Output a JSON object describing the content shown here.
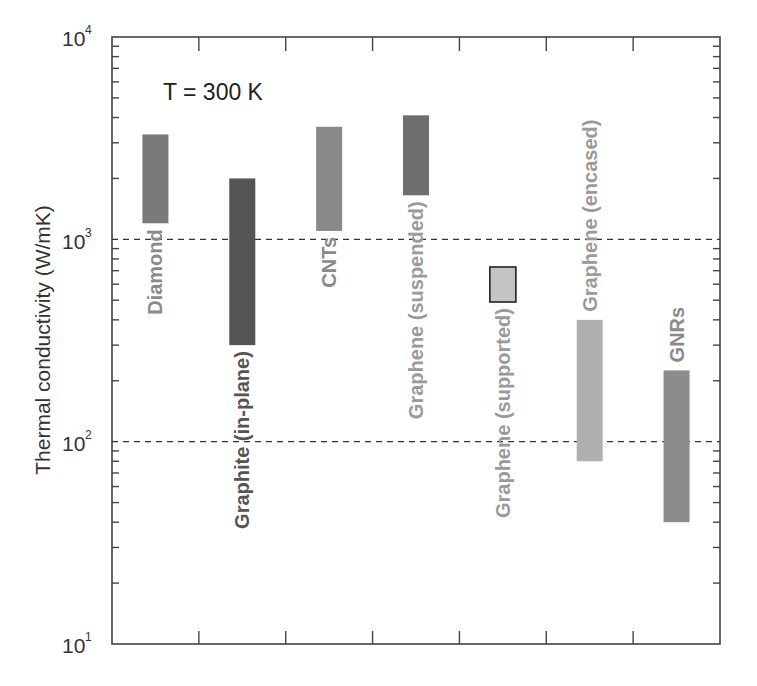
{
  "chart_data": {
    "type": "bar",
    "subtype": "floating-range-bar",
    "title": "",
    "annotation": "T = 300 K",
    "xlabel": "",
    "ylabel": "Thermal conductivity (W/mK)",
    "yscale": "log",
    "ylim": [
      10,
      10000
    ],
    "y_ticks": [
      {
        "base": "10",
        "exp": "1",
        "value": 10
      },
      {
        "base": "10",
        "exp": "2",
        "value": 100
      },
      {
        "base": "10",
        "exp": "3",
        "value": 1000
      },
      {
        "base": "10",
        "exp": "4",
        "value": 10000
      }
    ],
    "grid": {
      "dashed_horizontal_lines_at": [
        100,
        1000
      ]
    },
    "legend": null,
    "categories": [
      "Diamond",
      "Graphite (in-plane)",
      "CNTs",
      "Graphene (suspended)",
      "Graphene (supported)",
      "Graphene (encased)",
      "GNRs"
    ],
    "series": [
      {
        "name": "min",
        "values": [
          1200,
          300,
          1100,
          1650,
          490,
          80,
          40
        ]
      },
      {
        "name": "max",
        "values": [
          3300,
          2000,
          3600,
          4100,
          730,
          400,
          225
        ]
      }
    ],
    "bars": [
      {
        "label": "Diamond",
        "min": 1200,
        "max": 3300,
        "color": "#7a7a7a",
        "label_color": "#8a8a8a",
        "label_pos": "below"
      },
      {
        "label": "Graphite (in-plane)",
        "min": 300,
        "max": 2000,
        "color": "#555555",
        "label_color": "#555555",
        "label_pos": "below"
      },
      {
        "label": "CNTs",
        "min": 1100,
        "max": 3600,
        "color": "#8a8a8a",
        "label_color": "#8a8a8a",
        "label_pos": "below"
      },
      {
        "label": "Graphene (suspended)",
        "min": 1650,
        "max": 4100,
        "color": "#6e6e6e",
        "label_color": "#9a9a9a",
        "label_pos": "below"
      },
      {
        "label": "Graphene (supported)",
        "min": 490,
        "max": 730,
        "color": "#c4c4c4",
        "label_color": "#9a9a9a",
        "label_pos": "below",
        "outlined": true
      },
      {
        "label": "Graphene (encased)",
        "min": 80,
        "max": 400,
        "color": "#b0b0b0",
        "label_color": "#9a9a9a",
        "label_pos": "above"
      },
      {
        "label": "GNRs",
        "min": 40,
        "max": 225,
        "color": "#8c8c8c",
        "label_color": "#8a8a8a",
        "label_pos": "above"
      }
    ]
  },
  "labels": {
    "annotation": "T = 300 K",
    "ylabel": "Thermal conductivity (W/mK)",
    "y_base": "10",
    "y_exp_1": "1",
    "y_exp_2": "2",
    "y_exp_3": "3",
    "y_exp_4": "4"
  }
}
